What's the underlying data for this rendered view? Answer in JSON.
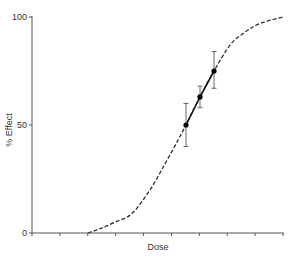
{
  "chart_data": {
    "type": "line",
    "title": "",
    "xlabel": "Dose",
    "ylabel": "% Effect",
    "ylim": [
      0,
      100
    ],
    "yticks": [
      0,
      50,
      100
    ],
    "ytick_labels": [
      "0",
      "50",
      "100"
    ],
    "xticks_count": 10,
    "xtick_labels": [],
    "grid": false,
    "legend": null,
    "series": [
      {
        "name": "dose-response curve",
        "style": "dashed",
        "x_px": [
          88,
          100,
          115,
          132,
          150,
          165,
          178,
          186,
          200,
          214,
          230,
          245,
          260,
          283
        ],
        "y": [
          0,
          2,
          5,
          9,
          20,
          32,
          43,
          50,
          63,
          75,
          87,
          93,
          97,
          100
        ]
      },
      {
        "name": "measured points",
        "style": "markers-solid-line",
        "x_px": [
          186,
          200,
          214
        ],
        "y": [
          50,
          63,
          75
        ],
        "error_low": [
          40,
          58,
          67
        ],
        "error_high": [
          60,
          68,
          84
        ]
      }
    ]
  },
  "labels": {
    "x_axis": "Dose",
    "y_axis": "% Effect",
    "y_ticks": [
      "0",
      "50",
      "100"
    ]
  }
}
